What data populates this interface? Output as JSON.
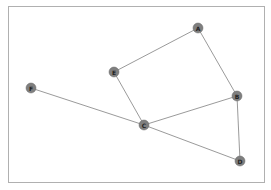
{
  "diagram": {
    "type": "graph",
    "directed": false,
    "frame": {
      "x": 8,
      "y": 6,
      "width": 256,
      "height": 176,
      "stroke": "#b0b0b0"
    },
    "style": {
      "node_fill": "#7f7f7f",
      "node_stroke": "#6a6a6a",
      "node_radius": 5,
      "edge_color": "#808080",
      "edge_width": 0.8,
      "label_color": "#222222"
    },
    "nodes": [
      {
        "id": "A",
        "label": "A",
        "x": 198,
        "y": 28
      },
      {
        "id": "B",
        "label": "B",
        "x": 237,
        "y": 96
      },
      {
        "id": "C",
        "label": "C",
        "x": 144,
        "y": 125
      },
      {
        "id": "D",
        "label": "D",
        "x": 240,
        "y": 161
      },
      {
        "id": "E",
        "label": "E",
        "x": 114,
        "y": 72
      },
      {
        "id": "F",
        "label": "F",
        "x": 31,
        "y": 88
      }
    ],
    "edges": [
      {
        "source": "A",
        "target": "E"
      },
      {
        "source": "A",
        "target": "B"
      },
      {
        "source": "E",
        "target": "C"
      },
      {
        "source": "F",
        "target": "C"
      },
      {
        "source": "C",
        "target": "B"
      },
      {
        "source": "C",
        "target": "D"
      },
      {
        "source": "B",
        "target": "D"
      }
    ]
  }
}
